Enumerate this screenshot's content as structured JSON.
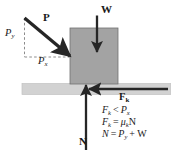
{
  "figure": {
    "type": "free-body-diagram",
    "colors": {
      "block_fill": "#a3a3a3",
      "block_stroke": "#6f6f6f",
      "ground_fill": "#d2d2d2",
      "ground_stroke": "#bdbdbd",
      "arrow": "#262626",
      "dashed": "#8c8c8c",
      "background": "#ffffff"
    }
  },
  "vectors": {
    "applied": {
      "label": "P",
      "direction": "down-right",
      "style": "solid-bold-arrow"
    },
    "applied_y_component": {
      "label": "P",
      "subscript": "y",
      "direction": "vertical",
      "style": "dashed"
    },
    "applied_x_component": {
      "label": "P",
      "subscript": "x",
      "direction": "horizontal",
      "style": "dashed"
    },
    "weight": {
      "label": "W",
      "direction": "down",
      "style": "solid-bold-arrow"
    },
    "normal": {
      "label": "N",
      "direction": "up",
      "style": "solid-bold-arrow"
    },
    "friction": {
      "label": "F",
      "subscript": "k",
      "direction": "left",
      "style": "solid-bold-arrow"
    }
  },
  "equations": [
    {
      "id": "friction-less-than-px",
      "lhs": "F",
      "lhs_sub": "k",
      "rel": "<",
      "rhs": "P",
      "rhs_sub": "x"
    },
    {
      "id": "friction-definition",
      "lhs": "F",
      "lhs_sub": "k",
      "rel": "=",
      "rhs": "μ",
      "rhs_sub": "k",
      "rhs_tail": "N"
    },
    {
      "id": "normal-force",
      "lhs": "N",
      "lhs_sub": "",
      "rel": "=",
      "rhs": "P",
      "rhs_sub": "y",
      "rhs_tail": "+ W"
    }
  ]
}
